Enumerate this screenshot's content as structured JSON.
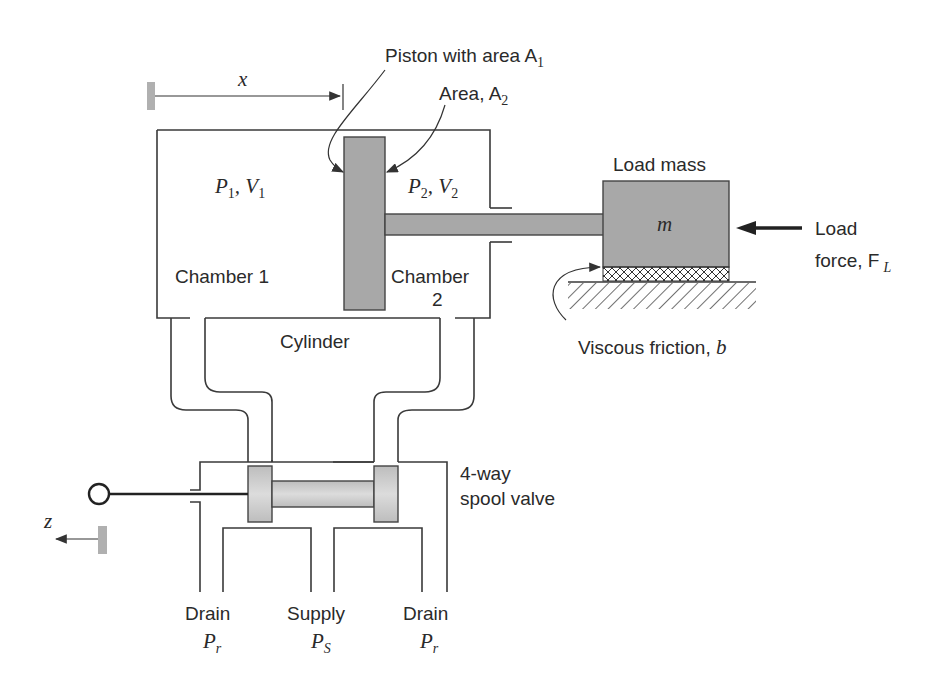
{
  "figure": {
    "colors": {
      "line": "#3a3a3a",
      "part_fill": "#a8a8a8",
      "background": "#ffffff"
    }
  },
  "labels": {
    "displacement_x": "x",
    "piston_area": "Piston with area A",
    "piston_area_sub": "1",
    "area2": "Area, A",
    "area2_sub": "2",
    "p1": "P",
    "p1_sub": "1",
    "v1": ", V",
    "v1_sub": "1",
    "p2": "P",
    "p2_sub": "2",
    "v2": ", V",
    "v2_sub": "2",
    "chamber1": "Chamber 1",
    "chamber2_line1": "Chamber",
    "chamber2_line2": "2",
    "cylinder": "Cylinder",
    "load_mass": "Load mass",
    "mass_symbol": "m",
    "load_force_line1": "Load",
    "load_force_line2": "force, F",
    "load_force_sub": "L",
    "viscous_friction": "Viscous friction, ",
    "viscous_friction_symbol": "b",
    "valve_line1": "4-way",
    "valve_line2": "spool valve",
    "spool_displacement": "z",
    "drain_left": "Drain",
    "drain_left_p": "P",
    "drain_left_sub": "r",
    "supply": "Supply",
    "supply_p": "P",
    "supply_sub": "S",
    "drain_right": "Drain",
    "drain_right_p": "P",
    "drain_right_sub": "r"
  }
}
